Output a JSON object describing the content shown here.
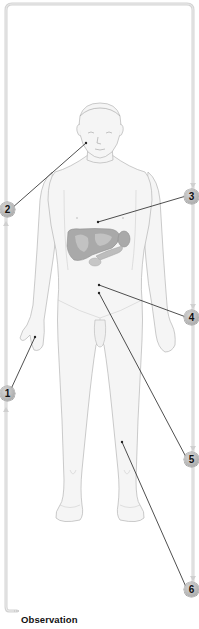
{
  "diagram": {
    "caption": "Observation",
    "colors": {
      "frame_line": "#d4d4d4",
      "body_outline": "#b9b9b9",
      "body_fill": "#f4f4f4",
      "organ_fill": "#a6a6a6",
      "leader_line": "#222222",
      "badge_fill": "#bdbdbd",
      "badge_text": "#111111"
    },
    "badges": [
      {
        "number": "1",
        "target": "hand"
      },
      {
        "number": "2",
        "target": "face"
      },
      {
        "number": "3",
        "target": "chest"
      },
      {
        "number": "4",
        "target": "upper-abdomen"
      },
      {
        "number": "5",
        "target": "lower-abdomen"
      },
      {
        "number": "6",
        "target": "lower-leg"
      }
    ],
    "organs_highlighted": [
      "liver",
      "gallbladder",
      "spleen",
      "pancreas"
    ]
  }
}
